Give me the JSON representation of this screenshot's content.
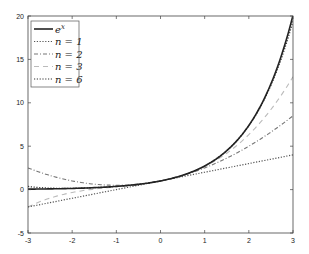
{
  "chart_data": {
    "type": "line",
    "title": "",
    "xlabel": "",
    "ylabel": "",
    "xlim": [
      -3,
      3
    ],
    "ylim": [
      -5,
      20
    ],
    "grid": false,
    "legend_position": "upper left",
    "x_ticks": [
      "-3",
      "-2",
      "-1",
      "0",
      "1",
      "2",
      "3"
    ],
    "y_ticks": [
      "-5",
      "0",
      "5",
      "10",
      "15",
      "20"
    ],
    "series": [
      {
        "name": "e^x",
        "style": "solid",
        "color": "#222222",
        "x": [
          -3,
          -2,
          -1,
          0,
          1,
          2,
          3
        ],
        "values": [
          0.0498,
          0.1353,
          0.3679,
          1,
          2.7183,
          7.3891,
          20.0855
        ]
      },
      {
        "name": "n = 1",
        "style": "dotted",
        "color": "#555555",
        "x": [
          -3,
          -2,
          -1,
          0,
          1,
          2,
          3
        ],
        "values": [
          -2,
          -1,
          0,
          1,
          2,
          3,
          4
        ]
      },
      {
        "name": "n = 2",
        "style": "dashdot",
        "color": "#777777",
        "x": [
          -3,
          -2,
          -1,
          0,
          1,
          2,
          3
        ],
        "values": [
          2.5,
          1,
          0.5,
          1,
          2.5,
          5,
          8.5
        ]
      },
      {
        "name": "n = 3",
        "style": "dashed",
        "color": "#bbbbbb",
        "x": [
          -3,
          -2,
          -1,
          0,
          1,
          2,
          3
        ],
        "values": [
          -2,
          -0.3333,
          0.3333,
          1,
          2.6667,
          6.3333,
          13
        ]
      },
      {
        "name": "n = 6",
        "style": "dotted",
        "color": "#333333",
        "x": [
          -3,
          -2,
          -1,
          0,
          1,
          2,
          3
        ],
        "values": [
          0.1375,
          0.1556,
          0.3681,
          1,
          2.7181,
          7.3556,
          19.4125
        ]
      }
    ]
  },
  "legend": {
    "items": [
      {
        "label_base": "e",
        "label_sup": "x"
      },
      {
        "label": "n = 1"
      },
      {
        "label": "n = 2"
      },
      {
        "label": "n = 3"
      },
      {
        "label": "n = 6"
      }
    ]
  }
}
